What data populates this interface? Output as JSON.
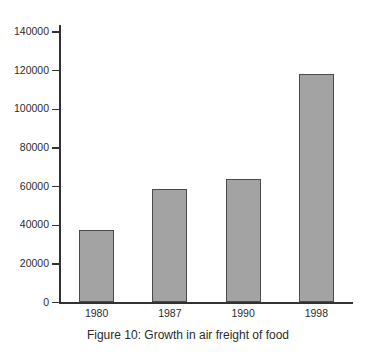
{
  "figure": {
    "caption": "Figure 10: Growth in air freight of food",
    "background_color": "#ffffff",
    "bar_fill_color": "#a3a3a3",
    "bar_outline_color": "#4a4a4a",
    "axis_color": "#333333",
    "text_color": "#2b2b2b"
  },
  "chart_data": {
    "type": "bar",
    "title": "Figure 10: Growth in air freight of food",
    "xlabel": "",
    "ylabel": "",
    "categories": [
      "1980",
      "1987",
      "1990",
      "1998"
    ],
    "values": [
      37500,
      58500,
      64000,
      118500
    ],
    "series": [
      {
        "name": "Air freight of food",
        "values": [
          37500,
          58500,
          64000,
          118500
        ]
      }
    ],
    "ylim": [
      0,
      140000
    ],
    "y_ticks": [
      0,
      20000,
      40000,
      60000,
      80000,
      100000,
      120000,
      140000
    ],
    "y_tick_labels": [
      "0",
      "20000",
      "40000",
      "60000",
      "80000",
      "100000",
      "120000",
      "140000"
    ],
    "grid": false,
    "legend": false,
    "legend_position": "none",
    "orientation": "vertical"
  }
}
